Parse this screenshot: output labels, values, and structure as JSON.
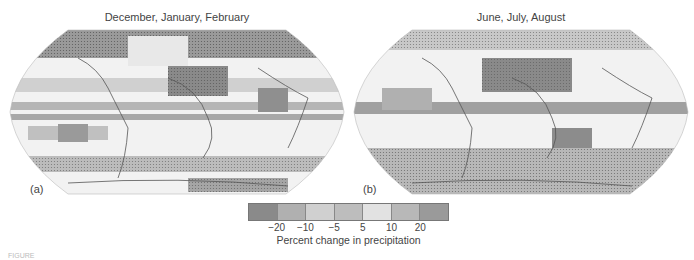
{
  "panels": [
    {
      "id": "a",
      "title": "December, January, February",
      "label": "(a)"
    },
    {
      "id": "b",
      "title": "June, July, August",
      "label": "(b)"
    }
  ],
  "legend": {
    "title": "Percent change in precipitation",
    "ticks": [
      "−20",
      "−10",
      "−5",
      "5",
      "10",
      "20"
    ],
    "swatches": [
      "#8a8a8a",
      "#b0b0b0",
      "#cfcfcf",
      "#bdbdbd",
      "#e2e2e2",
      "#b8b8b8",
      "#9a9a9a"
    ]
  },
  "colors": {
    "ocean_base": "#f2f2f2",
    "dark_gray": "#8a8a8a",
    "mid_gray": "#b5b5b5",
    "light_gray": "#d6d6d6",
    "coastline": "#555555"
  },
  "footer_text": "FIGURE"
}
